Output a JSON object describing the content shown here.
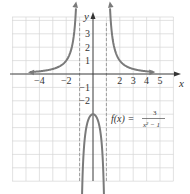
{
  "chart_data": {
    "type": "line",
    "title": "",
    "xlabel": "x",
    "ylabel": "y",
    "function": "f(x) = 3 / (x^2 - 1)",
    "annotation": {
      "lhs": "f(x) =",
      "numerator": "3",
      "denominator": "x² − 1"
    },
    "x_ticks": [
      {
        "value": -4,
        "label": "−4"
      },
      {
        "value": -2,
        "label": "−2"
      },
      {
        "value": 2,
        "label": "2"
      },
      {
        "value": 3,
        "label": "3"
      },
      {
        "value": 4,
        "label": "4"
      },
      {
        "value": 5,
        "label": "5"
      }
    ],
    "y_ticks": [
      {
        "value": 3,
        "label": "3"
      },
      {
        "value": 2,
        "label": "2"
      },
      {
        "value": 1,
        "label": "1"
      },
      {
        "value": -1,
        "label": "−1"
      },
      {
        "value": -2,
        "label": "−2"
      }
    ],
    "xlim": [
      -6,
      6
    ],
    "ylim": [
      -8,
      4.25
    ],
    "grid": true,
    "asymptotes": {
      "vertical": [
        -1,
        1
      ],
      "horizontal": [
        0
      ]
    },
    "series": [
      {
        "name": "left branch",
        "x": [
          -5,
          -4,
          -3,
          -2,
          -1.5,
          -1.25,
          -1.15
        ],
        "y": [
          0.125,
          0.2,
          0.375,
          1,
          2.4,
          5.33,
          9.3
        ]
      },
      {
        "name": "middle branch",
        "x": [
          -0.95,
          -0.9,
          -0.75,
          -0.5,
          0,
          0.5,
          0.75,
          0.9,
          0.95
        ],
        "y": [
          -30.8,
          -15.8,
          -6.86,
          -4,
          -3,
          -4,
          -6.86,
          -15.8,
          -30.8
        ]
      },
      {
        "name": "right branch",
        "x": [
          1.15,
          1.25,
          1.5,
          2,
          3,
          4,
          5
        ],
        "y": [
          9.3,
          5.33,
          2.4,
          1,
          0.375,
          0.2,
          0.125
        ]
      }
    ],
    "colors": {
      "curve": "#7a7a7a",
      "grid": "#d6d6d6",
      "axis": "#333333",
      "asymptote": "#8a8a8a"
    }
  }
}
